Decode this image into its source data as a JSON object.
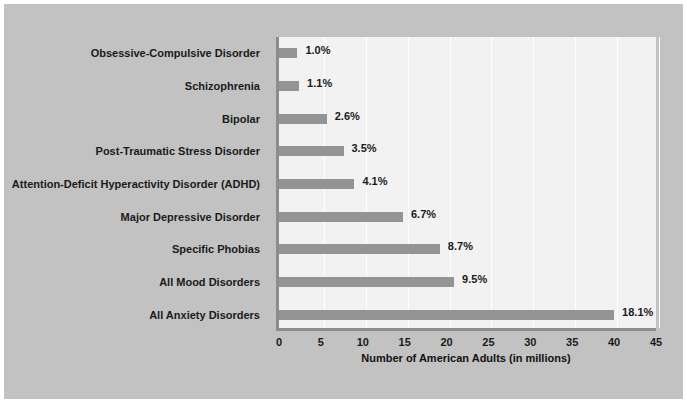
{
  "chart_data": {
    "type": "bar",
    "orientation": "horizontal",
    "title": "",
    "xlabel": "Number of American Adults (in millions)",
    "ylabel": "",
    "xlim": [
      0,
      45
    ],
    "xticks": [
      0,
      5,
      10,
      15,
      20,
      25,
      30,
      35,
      40,
      45
    ],
    "grid": true,
    "legend": false,
    "bar_color": "#949494",
    "plot_background": "#f2f2f2",
    "figure_background": "#c2c2c2",
    "categories": [
      "Obsessive-Compulsive Disorder",
      "Schizophrenia",
      "Bipolar",
      "Post-Traumatic Stress Disorder",
      "Attention-Deficit Hyperactivity Disorder (ADHD)",
      "Major Depressive Disorder",
      "Specific Phobias",
      "All Mood Disorders",
      "All Anxiety Disorders"
    ],
    "values": [
      2.2,
      2.4,
      5.7,
      7.7,
      9.0,
      14.8,
      19.2,
      20.9,
      40.0
    ],
    "data_labels": [
      "1.0%",
      "1.1%",
      "2.6%",
      "3.5%",
      "4.1%",
      "6.7%",
      "8.7%",
      "9.5%",
      "18.1%"
    ],
    "percent_values": [
      1.0,
      1.1,
      2.6,
      3.5,
      4.1,
      6.7,
      8.7,
      9.5,
      18.1
    ]
  }
}
